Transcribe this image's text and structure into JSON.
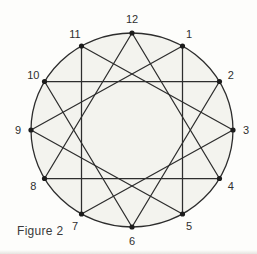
{
  "figure": {
    "caption": "Figure 2",
    "diagram": {
      "type": "circle-star",
      "description": "Circle with 12 points labeled like a clock face, joined by chords forming four overlapping triangles",
      "vertex_labels": [
        "12",
        "1",
        "2",
        "3",
        "4",
        "5",
        "6",
        "7",
        "8",
        "9",
        "10",
        "11"
      ],
      "chords": [
        [
          "12",
          "4"
        ],
        [
          "4",
          "8"
        ],
        [
          "8",
          "12"
        ],
        [
          "1",
          "5"
        ],
        [
          "5",
          "9"
        ],
        [
          "9",
          "1"
        ],
        [
          "2",
          "6"
        ],
        [
          "6",
          "10"
        ],
        [
          "10",
          "2"
        ],
        [
          "3",
          "7"
        ],
        [
          "7",
          "11"
        ],
        [
          "11",
          "3"
        ]
      ],
      "colors": {
        "line": "#2d2d2d",
        "circle_fill": "#f3f3ee",
        "dot": "#1c1c1c",
        "label": "#2f2f2f",
        "background": "#fdfdfb",
        "page_edge": "#d2d0ca"
      }
    }
  }
}
